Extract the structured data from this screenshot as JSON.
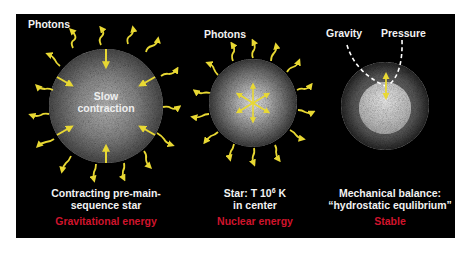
{
  "panels": [
    {
      "photons_label": "Photons",
      "center_label_line1": "Slow",
      "center_label_line2": "contraction",
      "caption_line1": "Contracting pre-main-",
      "caption_line2": "sequence star",
      "energy_label": "Gravitational energy"
    },
    {
      "photons_label": "Photons",
      "caption_line1_prefix": "Star: T  10",
      "caption_line1_exponent": "6",
      "caption_line1_suffix": " K",
      "caption_line2": "in center",
      "energy_label": "Nuclear energy"
    },
    {
      "gravity_label": "Gravity",
      "pressure_label": "Pressure",
      "caption_line1": "Mechanical balance:",
      "caption_line2": "“hydrostatic equlibrium”",
      "energy_label": "Stable"
    }
  ],
  "colors": {
    "background": "#000000",
    "photon_arrow": "#e8d833",
    "energy_label": "#d0142c",
    "caption_text": "#f2f2f2"
  }
}
